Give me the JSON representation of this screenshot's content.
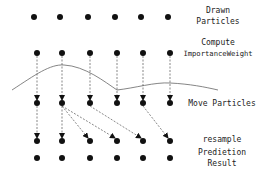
{
  "diagram": {
    "stages": [
      {
        "id": "drawn",
        "label_lines": [
          "Drawn",
          "Particles"
        ],
        "y": 17
      },
      {
        "id": "weight",
        "label_lines": [
          "Compute",
          "ImportanceWeight"
        ],
        "y": 53
      },
      {
        "id": "move",
        "label_lines": [
          "Move Particles"
        ],
        "y": 103
      },
      {
        "id": "resample",
        "label_lines": [
          "resample"
        ],
        "y": 141
      },
      {
        "id": "result",
        "label_lines": [
          "Predietion",
          "Result"
        ],
        "y": 158
      }
    ],
    "particle_x": [
      37,
      62,
      90,
      117,
      143,
      170
    ],
    "resample_links": [
      [
        0,
        0
      ],
      [
        1,
        1
      ],
      [
        1,
        2
      ],
      [
        1,
        3
      ],
      [
        2,
        4
      ],
      [
        4,
        5
      ]
    ],
    "colors": {
      "dot": "#111111",
      "line": "#555555",
      "curve": "#666666"
    }
  }
}
